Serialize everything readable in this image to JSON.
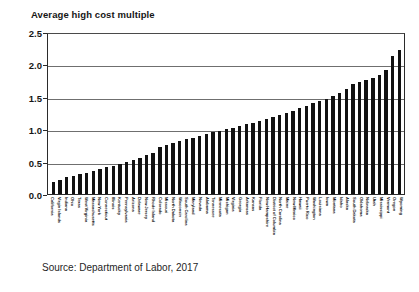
{
  "chart_data": {
    "type": "bar",
    "title": "Average high cost multiple",
    "xlabel": "",
    "ylabel": "",
    "ylim": [
      0.0,
      2.5
    ],
    "ytick_labels": [
      "2.5",
      "2.0",
      "1.5",
      "1.0",
      "0.5",
      "0.0"
    ],
    "ytick_values": [
      2.5,
      2.0,
      1.5,
      1.0,
      0.5,
      0.0
    ],
    "grid": true,
    "grid_axis": "y",
    "legend": "none",
    "bar_color": "#111111",
    "source_note": "Source:  Department of Labor, 2017",
    "categories": [
      "California",
      "Virgin Islands",
      "Indiana",
      "Ohio",
      "Texas",
      "West Virginia",
      "Massachusetts",
      "New York",
      "Connecticut",
      "Illinois",
      "Kentucky",
      "Pennsylvania",
      "Arizona",
      "Delaware",
      "New Jersey",
      "Rhode Island",
      "Colorado",
      "Missouri",
      "North Dakota",
      "Wisconsin",
      "South Carolina",
      "Maryland",
      "Nevada",
      "Alabama",
      "Tennessee",
      "Minnesota",
      "Michigan",
      "Virginia",
      "Georgia",
      "Arkansas",
      "Kansas",
      "Florida",
      "New Hampshire",
      "District of Columbia",
      "North Carolina",
      "Maine",
      "New Mexico",
      "Hawaii",
      "Puerto Rico",
      "Washington",
      "Louisiana",
      "Iowa",
      "Montana",
      "Idaho",
      "Alaska",
      "South Dakota",
      "Oklahoma",
      "Nebraska",
      "Utah",
      "Mississippi",
      "Vermont",
      "Oregon",
      "Wyoming"
    ],
    "values": [
      0.18,
      0.21,
      0.26,
      0.28,
      0.31,
      0.33,
      0.35,
      0.38,
      0.41,
      0.44,
      0.47,
      0.5,
      0.53,
      0.56,
      0.6,
      0.63,
      0.72,
      0.76,
      0.79,
      0.82,
      0.85,
      0.87,
      0.9,
      0.92,
      0.95,
      0.98,
      1.0,
      1.02,
      1.05,
      1.08,
      1.1,
      1.13,
      1.16,
      1.19,
      1.22,
      1.25,
      1.28,
      1.32,
      1.36,
      1.4,
      1.44,
      1.47,
      1.51,
      1.56,
      1.62,
      1.7,
      1.73,
      1.76,
      1.79,
      1.84,
      1.92,
      2.13,
      2.22
    ]
  }
}
